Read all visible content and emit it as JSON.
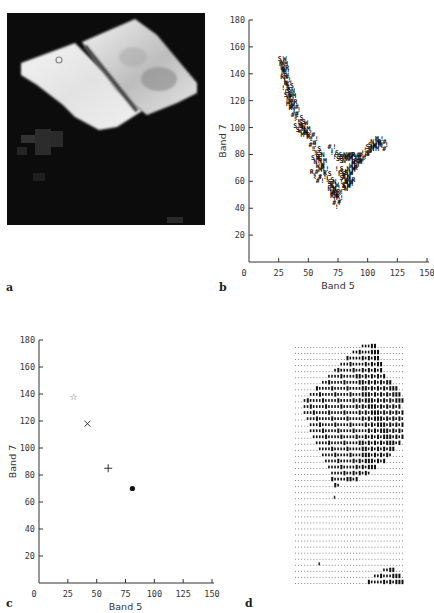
{
  "figure": {
    "panels": [
      {
        "id": "a",
        "label": "a",
        "type": "image",
        "description": "grayscale satellite image of two bright quadrilateral fields on a dark background"
      },
      {
        "id": "b",
        "label": "b",
        "type": "scatter"
      },
      {
        "id": "c",
        "label": "c",
        "type": "scatter"
      },
      {
        "id": "d",
        "label": "d",
        "type": "character-map"
      }
    ]
  },
  "chart_data": [
    {
      "panel": "b",
      "type": "scatter",
      "title": "",
      "xlabel": "Band 5",
      "ylabel": "Band 7",
      "xlim": [
        0,
        150
      ],
      "ylim": [
        0,
        180
      ],
      "xticks": [
        "0",
        "25",
        "50",
        "75",
        "100",
        "125",
        "150"
      ],
      "yticks": [
        "20",
        "40",
        "60",
        "80",
        "100",
        "120",
        "140",
        "160",
        "180"
      ],
      "grid": false,
      "marker": "alphanumeric characters (S, N, W, M, R, !, #)",
      "series": [
        {
          "name": "pixels",
          "points": [
            [
              28,
              152
            ],
            [
              29,
              148
            ],
            [
              30,
              145
            ],
            [
              31,
              142
            ],
            [
              30,
              138
            ],
            [
              32,
              136
            ],
            [
              33,
              134
            ],
            [
              31,
              130
            ],
            [
              34,
              132
            ],
            [
              35,
              128
            ],
            [
              33,
              125
            ],
            [
              36,
              124
            ],
            [
              37,
              120
            ],
            [
              35,
              118
            ],
            [
              38,
              116
            ],
            [
              40,
              114
            ],
            [
              39,
              110
            ],
            [
              42,
              108
            ],
            [
              44,
              105
            ],
            [
              41,
              102
            ],
            [
              46,
              104
            ],
            [
              48,
              100
            ],
            [
              45,
              98
            ],
            [
              50,
              97
            ],
            [
              52,
              95
            ],
            [
              55,
              92
            ],
            [
              54,
              88
            ],
            [
              57,
              85
            ],
            [
              58,
              82
            ],
            [
              60,
              80
            ],
            [
              56,
              78
            ],
            [
              62,
              76
            ],
            [
              60,
              72
            ],
            [
              64,
              70
            ],
            [
              55,
              68
            ],
            [
              58,
              64
            ],
            [
              62,
              64
            ],
            [
              66,
              66
            ],
            [
              68,
              62
            ],
            [
              70,
              60
            ],
            [
              72,
              58
            ],
            [
              70,
              55
            ],
            [
              73,
              53
            ],
            [
              75,
              52
            ],
            [
              72,
              50
            ],
            [
              76,
              48
            ],
            [
              74,
              45
            ],
            [
              78,
              56
            ],
            [
              80,
              60
            ],
            [
              82,
              64
            ],
            [
              84,
              67
            ],
            [
              86,
              70
            ],
            [
              88,
              72
            ],
            [
              90,
              74
            ],
            [
              92,
              76
            ],
            [
              94,
              78
            ],
            [
              96,
              80
            ],
            [
              98,
              82
            ],
            [
              100,
              84
            ],
            [
              102,
              86
            ],
            [
              104,
              88
            ],
            [
              106,
              90
            ],
            [
              108,
              88
            ],
            [
              110,
              92
            ],
            [
              112,
              90
            ],
            [
              114,
              88
            ],
            [
              70,
              86
            ],
            [
              72,
              82
            ],
            [
              75,
              80
            ],
            [
              78,
              79
            ],
            [
              80,
              79
            ],
            [
              83,
              80
            ],
            [
              86,
              80
            ],
            [
              88,
              78
            ],
            [
              90,
              80
            ],
            [
              92,
              79
            ],
            [
              95,
              78
            ],
            [
              76,
              70
            ],
            [
              78,
              66
            ],
            [
              80,
              68
            ],
            [
              82,
              58
            ],
            [
              84,
              60
            ],
            [
              86,
              62
            ]
          ]
        }
      ]
    },
    {
      "panel": "c",
      "type": "scatter",
      "title": "",
      "xlabel": "Band 5",
      "ylabel": "Band 7",
      "xlim": [
        0,
        150
      ],
      "ylim": [
        0,
        180
      ],
      "xticks": [
        "0",
        "25",
        "50",
        "75",
        "100",
        "125",
        "150"
      ],
      "yticks": [
        "20",
        "40",
        "60",
        "80",
        "100",
        "120",
        "140",
        "160",
        "180"
      ],
      "grid": false,
      "series": [
        {
          "name": "class-1",
          "marker": "star",
          "symbol": "☆",
          "x": 30,
          "y": 138
        },
        {
          "name": "class-2",
          "marker": "x",
          "symbol": "×",
          "x": 42,
          "y": 118
        },
        {
          "name": "class-3",
          "marker": "plus",
          "symbol": "+",
          "x": 60,
          "y": 85
        },
        {
          "name": "class-4",
          "marker": "dot",
          "symbol": "●",
          "x": 81,
          "y": 70
        }
      ]
    }
  ],
  "panel_d": {
    "rows": 40,
    "cols": 36,
    "background_char": ".",
    "fill_char": "▮",
    "blob_rows": [
      [
        22,
        26
      ],
      [
        19,
        27
      ],
      [
        17,
        27
      ],
      [
        15,
        28
      ],
      [
        13,
        28
      ],
      [
        11,
        29
      ],
      [
        9,
        31
      ],
      [
        7,
        33
      ],
      [
        5,
        34
      ],
      [
        3,
        35
      ],
      [
        3,
        34
      ],
      [
        3,
        35
      ],
      [
        4,
        35
      ],
      [
        5,
        36
      ],
      [
        5,
        36
      ],
      [
        6,
        35
      ],
      [
        7,
        34
      ],
      [
        8,
        32
      ],
      [
        9,
        31
      ],
      [
        10,
        29
      ],
      [
        11,
        26
      ],
      [
        12,
        24
      ],
      [
        12,
        20
      ],
      [
        13,
        14
      ],
      [],
      [],
      [],
      [],
      [],
      [],
      [],
      [],
      [],
      [],
      [],
      [],
      [],
      [
        29,
        32
      ],
      [
        26,
        34
      ],
      [
        24,
        36
      ]
    ],
    "stray_marks": [
      [
        13,
        25
      ],
      [
        8,
        36
      ]
    ]
  }
}
